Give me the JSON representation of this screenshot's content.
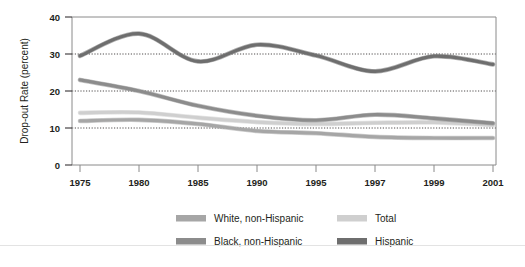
{
  "chart_data": {
    "type": "line",
    "title": "",
    "xlabel": "",
    "ylabel": "Drop-out Rate (percent)",
    "ylim": [
      0,
      40
    ],
    "yticks": [
      0,
      10,
      20,
      30,
      40
    ],
    "ytick_labels": [
      "0",
      "10",
      "20",
      "30",
      "40"
    ],
    "grid": "horizontal-dotted-at-10-20-30",
    "legend_position": "bottom",
    "categories": [
      "1975",
      "1980",
      "1985",
      "1990",
      "1995",
      "1997",
      "1999",
      "2001"
    ],
    "x": [
      1975,
      1980,
      1985,
      1990,
      1995,
      1997,
      1999,
      2001
    ],
    "series": [
      {
        "name": "White, non-Hispanic",
        "color": "#a6a6a6",
        "values": [
          11.9,
          12.2,
          11.1,
          9.2,
          8.6,
          7.6,
          7.3,
          7.3
        ]
      },
      {
        "name": "Black, non-Hispanic",
        "color": "#8c8c8c",
        "values": [
          23.0,
          20.0,
          16.0,
          13.3,
          12.1,
          13.6,
          12.6,
          11.3
        ]
      },
      {
        "name": "Total",
        "color": "#cfcfcf",
        "values": [
          14.1,
          14.2,
          12.8,
          11.6,
          11.1,
          11.4,
          11.5,
          10.8
        ]
      },
      {
        "name": "Hispanic",
        "color": "#6e6e6e",
        "values": [
          29.5,
          35.5,
          28.0,
          32.5,
          29.6,
          25.3,
          29.4,
          27.2
        ]
      }
    ]
  },
  "legend": {
    "items": [
      {
        "label": "White, non-Hispanic",
        "color": "#a6a6a6"
      },
      {
        "label": "Total",
        "color": "#cfcfcf"
      },
      {
        "label": "Black, non-Hispanic",
        "color": "#8c8c8c"
      },
      {
        "label": "Hispanic",
        "color": "#6e6e6e"
      }
    ]
  },
  "axis": {
    "y_title": "Drop-out Rate (percent)",
    "y_labels": [
      "40",
      "30",
      "20",
      "10",
      "0"
    ],
    "x_labels": [
      "1975",
      "1980",
      "1985",
      "1990",
      "1995",
      "1997",
      "1999",
      "2001"
    ]
  }
}
